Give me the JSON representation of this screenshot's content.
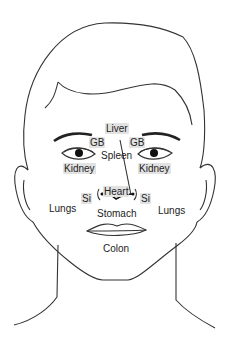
{
  "diagram": {
    "type": "face-map",
    "labels": {
      "liver": "Liver",
      "gb_left": "GB",
      "gb_right": "GB",
      "spleen": "Spleen",
      "kidney_left": "Kidney",
      "kidney_right": "Kidney",
      "heart": "Heart",
      "si_left": "Si",
      "si_right": "Si",
      "lungs_left": "Lungs",
      "lungs_right": "Lungs",
      "stomach": "Stomach",
      "colon": "Colon"
    },
    "colors": {
      "line": "#333333",
      "highlight": "#e2e2e2",
      "background": "#ffffff"
    }
  }
}
